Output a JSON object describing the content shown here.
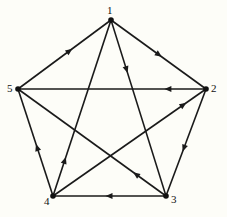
{
  "diagram": {
    "type": "directed-graph",
    "nodes": [
      {
        "id": "1",
        "label": "1",
        "x": 111,
        "y": 20,
        "label_dx": -4,
        "label_dy": -15
      },
      {
        "id": "2",
        "label": "2",
        "x": 206,
        "y": 89,
        "label_dx": 5,
        "label_dy": -6
      },
      {
        "id": "3",
        "label": "3",
        "x": 166,
        "y": 196,
        "label_dx": 5,
        "label_dy": -2
      },
      {
        "id": "4",
        "label": "4",
        "x": 53,
        "y": 196,
        "label_dx": -9,
        "label_dy": 0
      },
      {
        "id": "5",
        "label": "5",
        "x": 18,
        "y": 89,
        "label_dx": -11,
        "label_dy": -6
      }
    ],
    "edges": [
      {
        "from": "5",
        "to": "1",
        "arrow_pos": 0.55
      },
      {
        "from": "1",
        "to": "2",
        "arrow_pos": 0.5
      },
      {
        "from": "1",
        "to": "3",
        "arrow_pos": 0.28
      },
      {
        "from": "2",
        "to": "5",
        "arrow_pos": 0.2
      },
      {
        "from": "4",
        "to": "2",
        "arrow_pos": 0.85
      },
      {
        "from": "2",
        "to": "3",
        "arrow_pos": 0.55
      },
      {
        "from": "4",
        "to": "5",
        "arrow_pos": 0.45
      },
      {
        "from": "4",
        "to": "1",
        "arrow_pos": 0.2
      },
      {
        "from": "3",
        "to": "5",
        "arrow_pos": 0.2
      },
      {
        "from": "3",
        "to": "4",
        "arrow_pos": 0.5
      }
    ],
    "colors": {
      "edge": "#1a1a1a",
      "node": "#111111",
      "background": "#fdfdf8"
    }
  }
}
